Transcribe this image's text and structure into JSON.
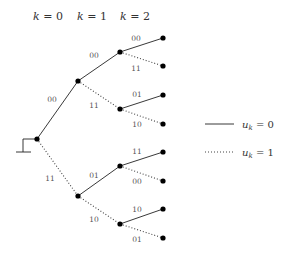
{
  "headers": [
    {
      "var": "k",
      "eq": " = ",
      "val": "0",
      "x": 48
    },
    {
      "var": "k",
      "eq": " = ",
      "val": "1",
      "x": 92
    },
    {
      "var": "k",
      "eq": " = ",
      "val": "2",
      "x": 135
    }
  ],
  "nodes": {
    "root": {
      "x": 37,
      "y": 139
    },
    "n1a": {
      "x": 78,
      "y": 81
    },
    "n1b": {
      "x": 78,
      "y": 196
    },
    "n2a": {
      "x": 120,
      "y": 52
    },
    "n2b": {
      "x": 120,
      "y": 109
    },
    "n2c": {
      "x": 120,
      "y": 166
    },
    "n2d": {
      "x": 120,
      "y": 224
    },
    "l1": {
      "x": 163,
      "y": 38
    },
    "l2": {
      "x": 163,
      "y": 66
    },
    "l3": {
      "x": 163,
      "y": 95
    },
    "l4": {
      "x": 163,
      "y": 124
    },
    "l5": {
      "x": 163,
      "y": 152
    },
    "l6": {
      "x": 163,
      "y": 181
    },
    "l7": {
      "x": 163,
      "y": 209
    },
    "l8": {
      "x": 163,
      "y": 238
    }
  },
  "edges": [
    {
      "from": "root",
      "to": "n1a",
      "u": 0,
      "label": "00",
      "lx": 52,
      "ly": 102
    },
    {
      "from": "root",
      "to": "n1b",
      "u": 1,
      "label": "11",
      "lx": 50,
      "ly": 181
    },
    {
      "from": "n1a",
      "to": "n2a",
      "u": 0,
      "label": "00",
      "lx": 94,
      "ly": 58
    },
    {
      "from": "n1a",
      "to": "n2b",
      "u": 1,
      "label": "11",
      "lx": 94,
      "ly": 108
    },
    {
      "from": "n1b",
      "to": "n2c",
      "u": 0,
      "label": "01",
      "lx": 94,
      "ly": 178
    },
    {
      "from": "n1b",
      "to": "n2d",
      "u": 1,
      "label": "10",
      "lx": 94,
      "ly": 222
    },
    {
      "from": "n2a",
      "to": "l1",
      "u": 0,
      "label": "00",
      "lx": 136,
      "ly": 41
    },
    {
      "from": "n2a",
      "to": "l2",
      "u": 1,
      "label": "11",
      "lx": 136,
      "ly": 71
    },
    {
      "from": "n2b",
      "to": "l3",
      "u": 0,
      "label": "01",
      "lx": 137,
      "ly": 97
    },
    {
      "from": "n2b",
      "to": "l4",
      "u": 1,
      "label": "10",
      "lx": 137,
      "ly": 127
    },
    {
      "from": "n2c",
      "to": "l5",
      "u": 0,
      "label": "11",
      "lx": 137,
      "ly": 154
    },
    {
      "from": "n2c",
      "to": "l6",
      "u": 1,
      "label": "00",
      "lx": 137,
      "ly": 184
    },
    {
      "from": "n2d",
      "to": "l7",
      "u": 0,
      "label": "10",
      "lx": 137,
      "ly": 212
    },
    {
      "from": "n2d",
      "to": "l8",
      "u": 1,
      "label": "01",
      "lx": 137,
      "ly": 242
    }
  ],
  "legend": [
    {
      "style": "solid",
      "var": "u",
      "sub": "k",
      "text": " = 0",
      "y": 124
    },
    {
      "style": "dotted",
      "var": "u",
      "sub": "k",
      "text": " = 1",
      "y": 152
    }
  ],
  "colors": {
    "line": "#222222",
    "node": "#000000",
    "label": "#555555"
  }
}
